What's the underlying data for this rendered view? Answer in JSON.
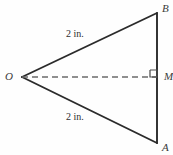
{
  "figure": {
    "type": "geometry-diagram",
    "background_color": "#fefefe",
    "stroke_color": "#2b2b2b",
    "dash_color": "#6b6b6b",
    "vertices": [
      {
        "id": "O",
        "label": "O",
        "x": 22,
        "y": 77,
        "style": "italic-serif"
      },
      {
        "id": "B",
        "label": "B",
        "x": 157,
        "y": 13,
        "style": "italic-serif"
      },
      {
        "id": "A",
        "label": "A",
        "x": 157,
        "y": 143,
        "style": "italic-serif"
      },
      {
        "id": "M",
        "label": "M",
        "x": 157,
        "y": 77,
        "style": "italic-serif"
      }
    ],
    "segments": [
      {
        "id": "OB",
        "from": "O",
        "to": "B",
        "style": "solid",
        "measure": "2 in."
      },
      {
        "id": "OA",
        "from": "O",
        "to": "A",
        "style": "solid",
        "measure": "2 in."
      },
      {
        "id": "BA",
        "from": "B",
        "to": "A",
        "style": "solid",
        "measure": ""
      },
      {
        "id": "OM",
        "from": "O",
        "to": "M",
        "style": "dashed",
        "measure": ""
      }
    ],
    "measure_labels": [
      {
        "id": "upper",
        "text": "2 in.",
        "for_segment": "OB",
        "x": 78,
        "y": 35
      },
      {
        "id": "lower",
        "text": "2 in.",
        "for_segment": "OA",
        "x": 78,
        "y": 118
      }
    ],
    "right_angle": {
      "at_vertex": "M",
      "marker": "square",
      "size": 7,
      "x": 149,
      "y": 70
    }
  }
}
